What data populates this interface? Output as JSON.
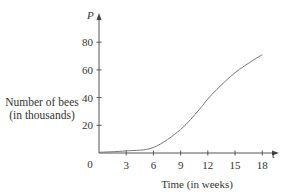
{
  "chart_data": {
    "type": "line",
    "title": "",
    "xlabel": "Time (in weeks)",
    "ylabel": "Number of bees (in thousands)",
    "ylabel_lines": [
      "Number of bees",
      "(in thousands)"
    ],
    "x_axis_symbol": "t",
    "y_axis_symbol": "P",
    "origin_label": "0",
    "x_ticks": [
      3,
      6,
      9,
      12,
      15,
      18
    ],
    "y_ticks": [
      20,
      40,
      60,
      80
    ],
    "xlim": [
      0,
      20
    ],
    "ylim": [
      0,
      90
    ],
    "grid": false,
    "legend": null,
    "series": [
      {
        "name": "P(t)",
        "x": [
          0,
          3,
          6,
          9,
          11,
          12,
          13,
          15,
          17,
          18
        ],
        "values": [
          0.5,
          1.5,
          4,
          17,
          31,
          39,
          46,
          58,
          67,
          71
        ]
      }
    ]
  }
}
